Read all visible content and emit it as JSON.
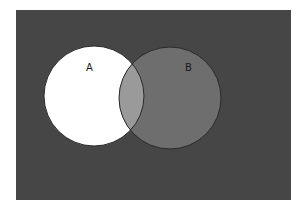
{
  "diagram": {
    "type": "venn",
    "background_color": "#464646",
    "frame": {
      "x": 16,
      "y": 10,
      "width": 275,
      "height": 190
    },
    "sets": [
      {
        "id": "A",
        "label": "A",
        "cx": 94,
        "cy": 96,
        "r": 50,
        "fill": "#ffffff",
        "stroke": "#2a2a2a",
        "label_x": 86,
        "label_y": 71
      },
      {
        "id": "B",
        "label": "B",
        "cx": 170,
        "cy": 98,
        "r": 51,
        "fill": "#6e6e6e",
        "stroke": "#2a2a2a",
        "label_x": 185,
        "label_y": 71
      }
    ],
    "intersection": {
      "sets": [
        "A",
        "B"
      ],
      "fill": "#9a9a9a"
    }
  }
}
